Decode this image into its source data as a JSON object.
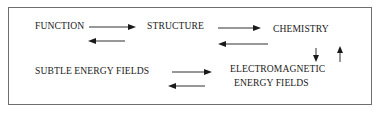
{
  "diagram": {
    "nodes": {
      "function": "FUNCTION",
      "structure": "STRUCTURE",
      "chemistry": "CHEMISTRY",
      "subtle": "SUBTLE ENERGY FIELDS",
      "electro_line1": "ELECTROMAGNETIC",
      "electro_line2": "ENERGY FIELDS"
    },
    "edges": [
      {
        "from": "FUNCTION",
        "to": "STRUCTURE",
        "direction": "right"
      },
      {
        "from": "STRUCTURE",
        "to": "FUNCTION",
        "direction": "left"
      },
      {
        "from": "STRUCTURE",
        "to": "CHEMISTRY",
        "direction": "right"
      },
      {
        "from": "CHEMISTRY",
        "to": "STRUCTURE",
        "direction": "left"
      },
      {
        "from": "CHEMISTRY",
        "to": "ELECTROMAGNETIC ENERGY FIELDS",
        "direction": "down"
      },
      {
        "from": "ELECTROMAGNETIC ENERGY FIELDS",
        "to": "CHEMISTRY",
        "direction": "up"
      },
      {
        "from": "SUBTLE ENERGY FIELDS",
        "to": "ELECTROMAGNETIC ENERGY FIELDS",
        "direction": "right"
      },
      {
        "from": "ELECTROMAGNETIC ENERGY FIELDS",
        "to": "SUBTLE ENERGY FIELDS",
        "direction": "left"
      }
    ],
    "colors": {
      "text": "#1a1a1a",
      "frame": "#6e6e6e",
      "arrow": "#1a1a1a"
    }
  }
}
